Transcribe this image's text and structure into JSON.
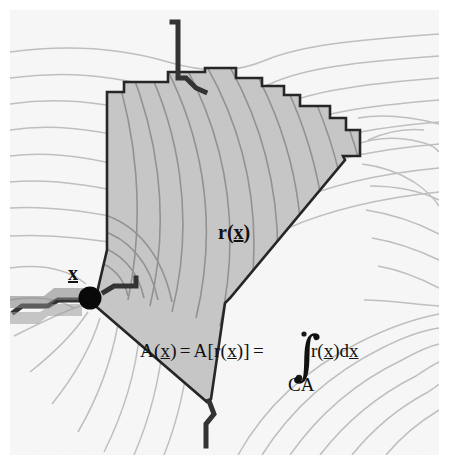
{
  "labels": {
    "flow_distance": {
      "base": "r(",
      "var": "x",
      "close": ")"
    },
    "outlet_point": {
      "var": "x"
    },
    "catchment_abbrev": "CA"
  },
  "formula": {
    "lhs": "A(",
    "lhs_var": "x",
    "lhs_close": ")",
    "eq1": "=",
    "mid": "A[r(",
    "mid_var": "x",
    "mid_close": ")]",
    "eq2": "=",
    "integral_glyph": "∫",
    "integrand": "r(",
    "integrand_var": "x",
    "integrand_close": ")d",
    "integrand_dvar": "x",
    "limit_label": "CA",
    "full_text": "A(x) = A[r(x)] = ∫CA r(x)dx"
  },
  "colors": {
    "background": "#ffffff",
    "map_background": "#f6f6f6",
    "catchment_fill": "#c4c4c4",
    "catchment_border": "#1a1a1a",
    "contour_outside": "#b9b9b9",
    "contour_inside": "#8e8e8e",
    "stream": "#2b2b2b",
    "outlet_dot": "#000000",
    "text": "#111111"
  },
  "geometry": {
    "catchment_boundary_note": "Stair-stepped divide on north and east, long straight diagonals on southwest and southeast converging at the outlet and the south vertex",
    "outlet_dot": {
      "x": 90,
      "y": 298,
      "r": 11
    },
    "image_margin_px": 10
  }
}
